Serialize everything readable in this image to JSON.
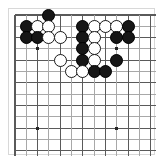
{
  "diagram": {
    "kind": "go-board-diagram",
    "caption": "",
    "board": {
      "columns_visible": 13,
      "rows_visible": 13,
      "cell_size_px": 11.3,
      "origin_px": {
        "x": 6,
        "y": 6
      },
      "grid_line_color": "#5a5a5a",
      "grid_line_color_light": "#a8a8a8",
      "border_color": "#d8d8d8",
      "background": "#ffffff",
      "edge_top": true,
      "edge_left": true,
      "edge_right": true,
      "edge_bottom": false
    },
    "colors": {
      "black_stone": "#161616",
      "white_stone_fill": "#ffffff",
      "white_stone_edge": "#1a1a1a",
      "hoshi": "#262626"
    },
    "hoshi_points": [
      {
        "col": 3,
        "row": 4
      },
      {
        "col": 10,
        "row": 4
      },
      {
        "col": 3,
        "row": 11
      },
      {
        "col": 10,
        "row": 11
      }
    ],
    "stones": [
      {
        "color": "black",
        "col": 4,
        "row": 1
      },
      {
        "color": "black",
        "col": 2,
        "row": 2
      },
      {
        "color": "white",
        "col": 3,
        "row": 2
      },
      {
        "color": "white",
        "col": 4,
        "row": 2
      },
      {
        "color": "black",
        "col": 7,
        "row": 2
      },
      {
        "color": "white",
        "col": 8,
        "row": 2
      },
      {
        "color": "white",
        "col": 9,
        "row": 2
      },
      {
        "color": "white",
        "col": 10,
        "row": 2
      },
      {
        "color": "black",
        "col": 11,
        "row": 2
      },
      {
        "color": "black",
        "col": 2,
        "row": 3
      },
      {
        "color": "black",
        "col": 3,
        "row": 3
      },
      {
        "color": "white",
        "col": 4,
        "row": 3
      },
      {
        "color": "white",
        "col": 5,
        "row": 3
      },
      {
        "color": "black",
        "col": 7,
        "row": 3
      },
      {
        "color": "white",
        "col": 8,
        "row": 3
      },
      {
        "color": "black",
        "col": 10,
        "row": 3
      },
      {
        "color": "black",
        "col": 11,
        "row": 3
      },
      {
        "color": "black",
        "col": 7,
        "row": 4
      },
      {
        "color": "white",
        "col": 8,
        "row": 4
      },
      {
        "color": "white",
        "col": 5,
        "row": 5
      },
      {
        "color": "black",
        "col": 7,
        "row": 5
      },
      {
        "color": "white",
        "col": 8,
        "row": 5
      },
      {
        "color": "black",
        "col": 10,
        "row": 5
      },
      {
        "color": "white",
        "col": 6,
        "row": 6
      },
      {
        "color": "white",
        "col": 7,
        "row": 6
      },
      {
        "color": "black",
        "col": 8,
        "row": 6
      },
      {
        "color": "black",
        "col": 9,
        "row": 6
      }
    ],
    "counts": {
      "black": 15,
      "white": 11,
      "total": 26
    }
  }
}
